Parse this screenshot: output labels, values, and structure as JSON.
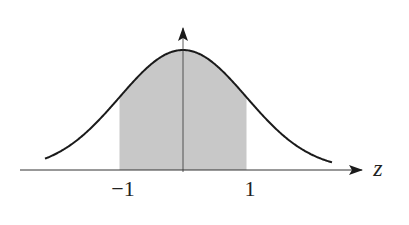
{
  "figure": {
    "x_axis_label": "z",
    "tick_labels": [
      "−1",
      "1"
    ],
    "shade_from": -1,
    "shade_to": 1,
    "colors": {
      "curve": "#1a1a1a",
      "axis": "#333333",
      "shade": "#c8c8c8"
    }
  }
}
